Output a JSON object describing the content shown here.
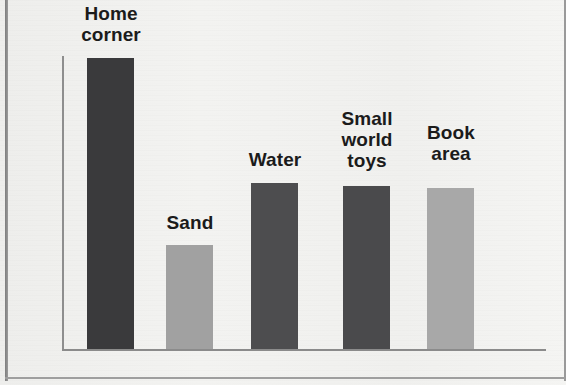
{
  "figure": {
    "background_color": "#f2f2f0",
    "axis_color": "#8b8b8b",
    "label_color": "#1b1b1b"
  },
  "chart_data": {
    "type": "bar",
    "title": "",
    "subtitle": "",
    "xlabel": "",
    "ylabel": "",
    "grid": false,
    "legend": "none",
    "axis_ranges": {
      "ylim": [
        0,
        100
      ]
    },
    "categories": [
      "Home\ncorner",
      "Sand",
      "Water",
      "Small\nworld\ntoys",
      "Book\narea"
    ],
    "category_labels_flat": [
      "Home corner",
      "Sand",
      "Water",
      "Small world toys",
      "Book area"
    ],
    "values": [
      100,
      36,
      57,
      56,
      55
    ],
    "bar_colors": [
      "#3a3a3c",
      "#a1a1a1",
      "#4d4d4f",
      "#4a4a4c",
      "#a8a8a8"
    ],
    "bars": [
      {
        "label": "Home\ncorner",
        "value": 100,
        "color": "#3a3a3c",
        "x": 87,
        "width": 47,
        "top": 58,
        "label_x": 74,
        "label_y": 3,
        "label_width": 74
      },
      {
        "label": "Sand",
        "value": 36,
        "color": "#a1a1a1",
        "x": 166,
        "width": 47,
        "top": 245,
        "label_x": 153,
        "label_y": 212,
        "label_width": 74
      },
      {
        "label": "Water",
        "value": 57,
        "color": "#4d4d4f",
        "x": 251,
        "width": 47,
        "top": 183,
        "label_x": 238,
        "label_y": 149,
        "label_width": 74
      },
      {
        "label": "Small\nworld\ntoys",
        "value": 56,
        "color": "#4a4a4c",
        "x": 343,
        "width": 47,
        "top": 186,
        "label_x": 330,
        "label_y": 108,
        "label_width": 74
      },
      {
        "label": "Book\narea",
        "value": 55,
        "color": "#a8a8a8",
        "x": 427,
        "width": 47,
        "top": 188,
        "label_x": 414,
        "label_y": 122,
        "label_width": 74
      }
    ]
  }
}
